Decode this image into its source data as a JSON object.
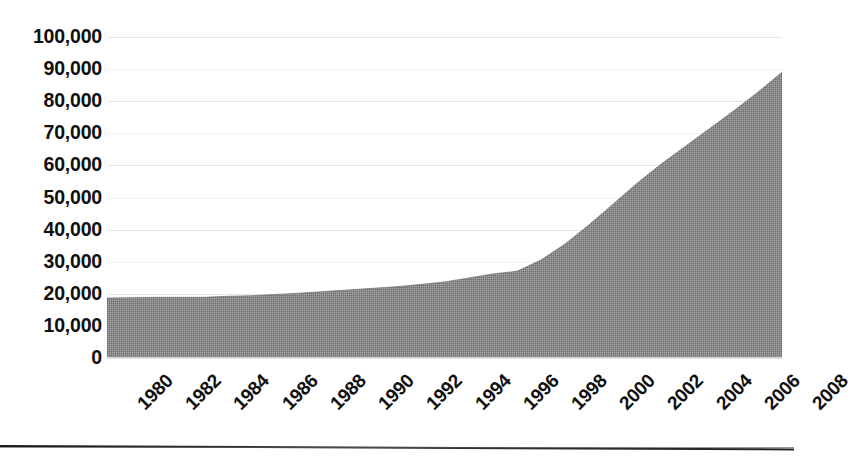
{
  "chart_data": {
    "type": "area",
    "title": "",
    "subtitle": "",
    "xlabel": "",
    "ylabel": "",
    "xlim": [
      1980,
      2008
    ],
    "ylim": [
      0,
      100000
    ],
    "grid": true,
    "legend": false,
    "legend_position": "none",
    "series_color": "#8a8a8a",
    "x_tick_labels": [
      "1980",
      "1982",
      "1984",
      "1986",
      "1988",
      "1990",
      "1992",
      "1994",
      "1996",
      "1998",
      "2000",
      "2002",
      "2004",
      "2006",
      "2008"
    ],
    "y_tick_labels": [
      "100,000",
      "90,000",
      "80,000",
      "70,000",
      "60,000",
      "50,000",
      "40,000",
      "30,000",
      "20,000",
      "10,000",
      "0"
    ],
    "y_tick_values": [
      100000,
      90000,
      80000,
      70000,
      60000,
      50000,
      40000,
      30000,
      20000,
      10000,
      0
    ],
    "categories": [
      1980,
      1981,
      1982,
      1983,
      1984,
      1985,
      1986,
      1987,
      1988,
      1989,
      1990,
      1991,
      1992,
      1993,
      1994,
      1995,
      1996,
      1997,
      1998,
      1999,
      2000,
      2001,
      2002,
      2003,
      2004,
      2005,
      2006,
      2007,
      2008
    ],
    "values": [
      18700,
      18800,
      18900,
      18900,
      18900,
      19200,
      19400,
      19800,
      20200,
      20700,
      21200,
      21700,
      22200,
      22900,
      23700,
      24900,
      26200,
      27000,
      30500,
      35500,
      41500,
      48000,
      54500,
      60500,
      66000,
      71500,
      77000,
      82800,
      89000
    ]
  },
  "axis": {
    "y_label_format": "comma-separated thousands",
    "x_label_rotation": "-45deg"
  }
}
